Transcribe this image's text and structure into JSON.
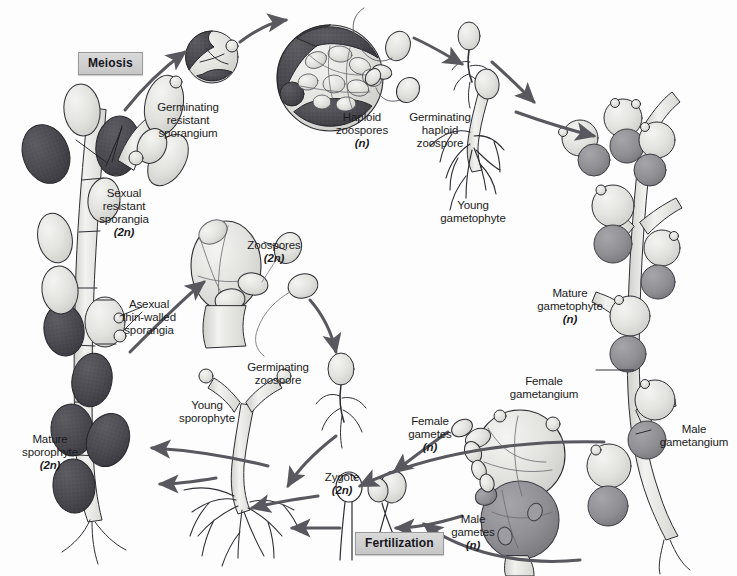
{
  "diagram": {
    "width": 737,
    "height": 576,
    "colors": {
      "background": "#fdfdfd",
      "ink": "#1b1b22",
      "arrow": "#58585e",
      "dark_sporangium": "#4a4a50",
      "mid_gametangium": "#8e8e93",
      "light_cell": "#e2e2e0",
      "phase_box_fill": "#d2d2d2",
      "phase_box_border": "#9a9a9a"
    }
  },
  "phase_boxes": [
    {
      "id": "meiosis",
      "label": "Meiosis",
      "x": 78,
      "y": 52
    },
    {
      "id": "fertilization",
      "label": "Fertilization",
      "x": 355,
      "y": 532
    }
  ],
  "labels": [
    {
      "id": "germinating-resistant-sporangium",
      "text": "Germinating\nresistant\nsporangium",
      "ploidy": "",
      "x": 188,
      "y": 88,
      "align": "center"
    },
    {
      "id": "haploid-zoospores",
      "text": "Haploid\nzoospores",
      "ploidy": "(n)",
      "x": 362,
      "y": 98,
      "align": "center"
    },
    {
      "id": "germinating-haploid-zoospore",
      "text": "Germinating\nhaploid\nzoospore",
      "ploidy": "",
      "x": 440,
      "y": 98,
      "align": "center"
    },
    {
      "id": "young-gametophyte",
      "text": "Young\ngametophyte",
      "ploidy": "",
      "x": 473,
      "y": 186,
      "align": "center"
    },
    {
      "id": "mature-gametophyte",
      "text": "Mature\ngametophyte",
      "ploidy": "(n)",
      "x": 570,
      "y": 274,
      "align": "center"
    },
    {
      "id": "female-gametangium",
      "text": "Female\ngametangium",
      "ploidy": "",
      "x": 548,
      "y": 368,
      "align": "center"
    },
    {
      "id": "male-gametangium",
      "text": "Male\ngametangium",
      "ploidy": "",
      "x": 655,
      "y": 414,
      "align": "center"
    },
    {
      "id": "female-gametes",
      "text": "Female\ngametes",
      "ploidy": "(n)",
      "x": 429,
      "y": 405,
      "align": "center"
    },
    {
      "id": "male-gametes",
      "text": "Male\ngametes",
      "ploidy": "(n)",
      "x": 466,
      "y": 506,
      "align": "center"
    },
    {
      "id": "zygote",
      "text": "Zygote",
      "ploidy": "(2n)",
      "x": 337,
      "y": 462,
      "align": "center"
    },
    {
      "id": "young-sporophyte",
      "text": "Young\nsporophyte",
      "ploidy": "",
      "x": 206,
      "y": 389,
      "align": "center"
    },
    {
      "id": "mature-sporophyte",
      "text": "Mature\nsporophyte",
      "ploidy": "(2n)",
      "x": 20,
      "y": 422,
      "align": "center"
    },
    {
      "id": "asexual-thin-walled-sporangia",
      "text": "Asexual\nthin-walled\nsporangia",
      "ploidy": "",
      "x": 110,
      "y": 287,
      "align": "center"
    },
    {
      "id": "sexual-resistant-sporangia",
      "text": "Sexual\nresistant\nsporangia",
      "ploidy": "(2n)",
      "x": 95,
      "y": 176,
      "align": "center"
    },
    {
      "id": "zoospores",
      "text": "Zoospores",
      "ploidy": "(2n)",
      "x": 242,
      "y": 228,
      "align": "center"
    },
    {
      "id": "germinating-zoospore",
      "text": "Germinating\nzoospore",
      "ploidy": "",
      "x": 278,
      "y": 352,
      "align": "center"
    }
  ],
  "stages": [
    {
      "id": "sexual-resistant-sporangia",
      "kind": "sporophyte-branch",
      "ploidy": "2n"
    },
    {
      "id": "germinating-resistant-sporangium",
      "kind": "sporangium",
      "ploidy": "2n"
    },
    {
      "id": "haploid-zoospores",
      "kind": "zoospore-cluster",
      "ploidy": "n"
    },
    {
      "id": "germinating-haploid-zoospore",
      "kind": "germling",
      "ploidy": "n"
    },
    {
      "id": "young-gametophyte",
      "kind": "germling-rhizoid",
      "ploidy": "n"
    },
    {
      "id": "mature-gametophyte",
      "kind": "gametophyte-thallus",
      "ploidy": "n"
    },
    {
      "id": "gametangia-pair",
      "kind": "gametangia",
      "ploidy": "n"
    },
    {
      "id": "gametes",
      "kind": "gametes",
      "ploidy": "n"
    },
    {
      "id": "zygote",
      "kind": "zygote",
      "ploidy": "2n"
    },
    {
      "id": "young-sporophyte",
      "kind": "germling-rhizoid",
      "ploidy": "2n"
    },
    {
      "id": "mature-sporophyte",
      "kind": "sporophyte-thallus",
      "ploidy": "2n"
    },
    {
      "id": "asexual-thin-walled-sporangia",
      "kind": "thin-sporangium",
      "ploidy": "2n"
    },
    {
      "id": "zoospores",
      "kind": "zoospore-cluster",
      "ploidy": "2n"
    },
    {
      "id": "germinating-zoospore",
      "kind": "germling",
      "ploidy": "2n"
    }
  ],
  "cycle_arrows": [
    {
      "id": "arrow-sporophyte-to-meiosis",
      "from": "sexual-resistant-sporangia",
      "to": "germinating-resistant-sporangium"
    },
    {
      "id": "arrow-sporangium-to-zoospores",
      "from": "germinating-resistant-sporangium",
      "to": "haploid-zoospores"
    },
    {
      "id": "arrow-zoospore-to-germinating",
      "from": "haploid-zoospores",
      "to": "germinating-haploid-zoospore"
    },
    {
      "id": "arrow-germinating-to-young-gametophyte",
      "from": "germinating-haploid-zoospore",
      "to": "young-gametophyte"
    },
    {
      "id": "arrow-young-to-mature-gametophyte",
      "from": "young-gametophyte",
      "to": "mature-gametophyte"
    },
    {
      "id": "arrow-gametes-to-fertilization",
      "from": "gametes",
      "to": "zygote"
    },
    {
      "id": "arrow-zygote-to-young-sporophyte",
      "from": "zygote",
      "to": "young-sporophyte"
    },
    {
      "id": "arrow-young-to-mature-sporophyte",
      "from": "young-sporophyte",
      "to": "mature-sporophyte"
    },
    {
      "id": "arrow-asexual-to-zoospores",
      "from": "asexual-thin-walled-sporangia",
      "to": "zoospores"
    },
    {
      "id": "arrow-zoospores-to-germinating-zoospore",
      "from": "zoospores",
      "to": "germinating-zoospore"
    },
    {
      "id": "arrow-germinating-zoospore-to-sporophyte",
      "from": "germinating-zoospore",
      "to": "young-sporophyte"
    }
  ]
}
